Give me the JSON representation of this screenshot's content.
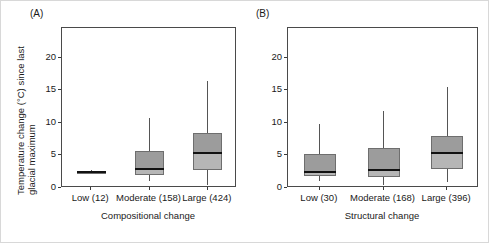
{
  "figure": {
    "panels": [
      {
        "id": "A",
        "label": "(A)",
        "xlabel": "Compositional change",
        "ylabel_line1": "Temperature change (°C) since last",
        "ylabel_line2": "glacial maximum",
        "show_yaxis": true
      },
      {
        "id": "B",
        "label": "(B)",
        "xlabel": "Structural change",
        "show_yaxis": true
      }
    ]
  },
  "chart_data": [
    {
      "type": "box",
      "panel": "A",
      "title": "(A)",
      "xlabel": "Compositional change",
      "ylabel": "Temperature change (°C) since last glacial maximum",
      "ylim": [
        0,
        24.6
      ],
      "yticks": [
        0,
        5,
        10,
        15,
        20
      ],
      "grid": false,
      "legend": "none",
      "categories": [
        "Low (12)",
        "Moderate (158)",
        "Large (424)"
      ],
      "group_counts": [
        12,
        158,
        424
      ],
      "boxes": [
        {
          "category": "Low (12)",
          "whisker_low": 2.2,
          "q1": 2.25,
          "median": 2.4,
          "q3": 2.6,
          "whisker_high": 2.7
        },
        {
          "category": "Moderate (158)",
          "whisker_low": 1.0,
          "q1": 2.0,
          "median": 2.9,
          "q3": 5.7,
          "whisker_high": 10.8
        },
        {
          "category": "Large (424)",
          "whisker_low": 0.4,
          "q1": 2.7,
          "median": 5.4,
          "q3": 8.4,
          "whisker_high": 16.5
        }
      ]
    },
    {
      "type": "box",
      "panel": "B",
      "title": "(B)",
      "xlabel": "Structural change",
      "ylabel": "Temperature change (°C) since last glacial maximum",
      "ylim": [
        0,
        24.6
      ],
      "yticks": [
        0,
        5,
        10,
        15,
        20
      ],
      "grid": false,
      "legend": "none",
      "categories": [
        "Low (30)",
        "Moderate (168)",
        "Large (396)"
      ],
      "group_counts": [
        30,
        168,
        396
      ],
      "boxes": [
        {
          "category": "Low (30)",
          "whisker_low": 1.1,
          "q1": 1.9,
          "median": 2.5,
          "q3": 5.2,
          "whisker_high": 9.9
        },
        {
          "category": "Moderate (168)",
          "whisker_low": 0.4,
          "q1": 1.7,
          "median": 2.8,
          "q3": 6.1,
          "whisker_high": 11.9
        },
        {
          "category": "Large (396)",
          "whisker_low": 0.9,
          "q1": 2.9,
          "median": 5.4,
          "q3": 8.0,
          "whisker_high": 15.6
        }
      ]
    }
  ],
  "style": {
    "box_fill_upper": "#9c9c9c",
    "box_fill_lower": "#b6b6b6",
    "box_edge": "#6e6e6e",
    "median_color": "#121212",
    "whisker_color": "#555555",
    "axis_color": "#4a4a4a",
    "text_color": "#1a1a1a",
    "background": "#ffffff"
  }
}
